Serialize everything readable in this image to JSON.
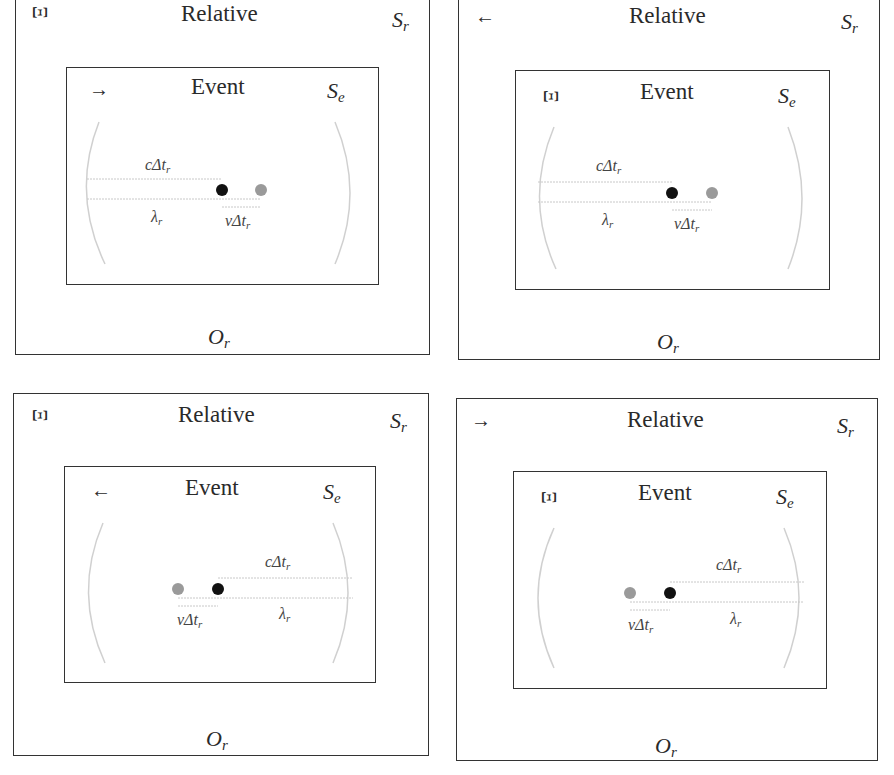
{
  "panels": [
    {
      "id": "top-left",
      "outer": {
        "title": "Relative",
        "frame_symbol": "S",
        "frame_sub": "r",
        "corner_icon": "Ξ",
        "corner_icon_name": "xi-glyph",
        "observer": "O",
        "observer_sub": "r"
      },
      "inner": {
        "title": "Event",
        "frame_symbol": "S",
        "frame_sub": "e",
        "corner_icon": "→",
        "corner_icon_name": "arrow-right-icon"
      },
      "labels": {
        "c_dt": "cΔt",
        "c_dt_sub": "r",
        "lambda": "λ",
        "lambda_sub": "r",
        "v_dt": "vΔt",
        "v_dt_sub": "r"
      }
    },
    {
      "id": "top-right",
      "outer": {
        "title": "Relative",
        "frame_symbol": "S",
        "frame_sub": "r",
        "corner_icon": "←",
        "corner_icon_name": "arrow-left-icon",
        "observer": "O",
        "observer_sub": "r"
      },
      "inner": {
        "title": "Event",
        "frame_symbol": "S",
        "frame_sub": "e",
        "corner_icon": "Ξ",
        "corner_icon_name": "xi-glyph"
      },
      "labels": {
        "c_dt": "cΔt",
        "c_dt_sub": "r",
        "lambda": "λ",
        "lambda_sub": "r",
        "v_dt": "vΔt",
        "v_dt_sub": "r"
      }
    },
    {
      "id": "bottom-left",
      "outer": {
        "title": "Relative",
        "frame_symbol": "S",
        "frame_sub": "r",
        "corner_icon": "Ξ",
        "corner_icon_name": "xi-glyph",
        "observer": "O",
        "observer_sub": "r"
      },
      "inner": {
        "title": "Event",
        "frame_symbol": "S",
        "frame_sub": "e",
        "corner_icon": "←",
        "corner_icon_name": "arrow-left-icon"
      },
      "labels": {
        "c_dt": "cΔt",
        "c_dt_sub": "r",
        "lambda": "λ",
        "lambda_sub": "r",
        "v_dt": "vΔt",
        "v_dt_sub": "r"
      }
    },
    {
      "id": "bottom-right",
      "outer": {
        "title": "Relative",
        "frame_symbol": "S",
        "frame_sub": "r",
        "corner_icon": "→",
        "corner_icon_name": "arrow-right-icon",
        "observer": "O",
        "observer_sub": "r"
      },
      "inner": {
        "title": "Event",
        "frame_symbol": "S",
        "frame_sub": "e",
        "corner_icon": "Ξ",
        "corner_icon_name": "xi-glyph"
      },
      "labels": {
        "c_dt": "cΔt",
        "c_dt_sub": "r",
        "lambda": "λ",
        "lambda_sub": "r",
        "v_dt": "vΔt",
        "v_dt_sub": "r"
      }
    }
  ],
  "colors": {
    "frame": "#333333",
    "source_dot": "#111111",
    "prior_dot": "#9a9a9a",
    "wavefront": "#d0d0d0",
    "measure_line": "#c8c8c8"
  }
}
